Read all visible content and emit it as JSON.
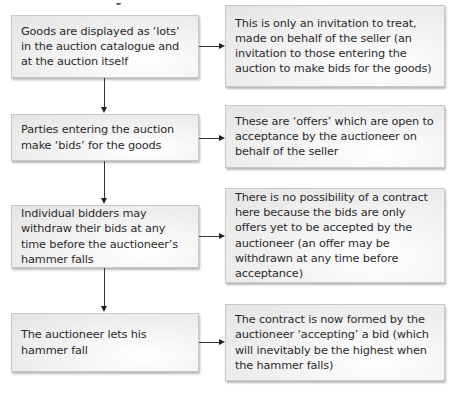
{
  "diagram": {
    "type": "flowchart",
    "left_column": [
      {
        "id": "step-1",
        "text": "Goods are displayed as ‘lots’ in the auction catalogue and at the auction itself"
      },
      {
        "id": "step-2",
        "text": "Parties entering the auction make ‘bids’ for the goods"
      },
      {
        "id": "step-3",
        "text": "Individual bidders may withdraw their bids at any time before the auctioneer’s hammer falls"
      },
      {
        "id": "step-4",
        "text": "The auctioneer lets his hammer fall"
      }
    ],
    "right_column": [
      {
        "id": "explanation-1",
        "text": "This is only an invitation to treat, made on behalf of the seller (an invitation to those entering the auction to make bids for the goods)"
      },
      {
        "id": "explanation-2",
        "text": "These are ‘offers’ which are open to acceptance by the auctioneer on behalf of the seller"
      },
      {
        "id": "explanation-3",
        "text": "There is no possibility of a contract here because the bids are only offers yet to be accepted by the auctioneer (an offer may be withdrawn at any time before acceptance)"
      },
      {
        "id": "explanation-4",
        "text": "The contract is now formed by the auctioneer ‘accepting’ a bid (which will inevitably be the highest when the hammer falls)"
      }
    ],
    "edges": [
      {
        "from": "step-1",
        "to": "step-2",
        "direction": "down"
      },
      {
        "from": "step-2",
        "to": "step-3",
        "direction": "down"
      },
      {
        "from": "step-3",
        "to": "step-4",
        "direction": "down"
      },
      {
        "from": "step-1",
        "to": "explanation-1",
        "direction": "right"
      },
      {
        "from": "step-2",
        "to": "explanation-2",
        "direction": "right"
      },
      {
        "from": "step-3",
        "to": "explanation-3",
        "direction": "right"
      },
      {
        "from": "step-4",
        "to": "explanation-4",
        "direction": "right"
      }
    ],
    "colors": {
      "box_border": "#c9c9c9",
      "box_fill_light": "#ffffff",
      "box_fill_dark": "#e4e4e4",
      "connector": "#333333",
      "text": "#2a2a2a"
    }
  }
}
